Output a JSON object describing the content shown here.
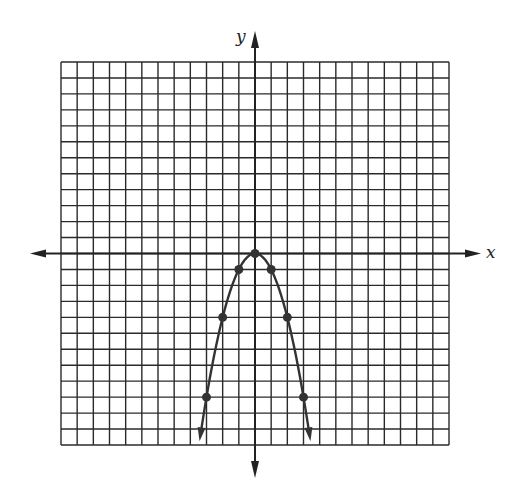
{
  "chart_data": {
    "type": "line",
    "title": "",
    "xlabel": "x",
    "ylabel": "y",
    "xlim": [
      -12,
      12
    ],
    "ylim": [
      -12,
      12
    ],
    "grid": true,
    "grid_step": 1,
    "series": [
      {
        "name": "y = -x^2",
        "points": [
          {
            "x": -3,
            "y": -9
          },
          {
            "x": -2,
            "y": -4
          },
          {
            "x": -1,
            "y": -1
          },
          {
            "x": 0,
            "y": 0
          },
          {
            "x": 1,
            "y": -1
          },
          {
            "x": 2,
            "y": -4
          },
          {
            "x": 3,
            "y": -9
          }
        ],
        "curve_extends_to_y": -11.4,
        "arrows_at_ends": true,
        "color": "#333333"
      }
    ]
  }
}
